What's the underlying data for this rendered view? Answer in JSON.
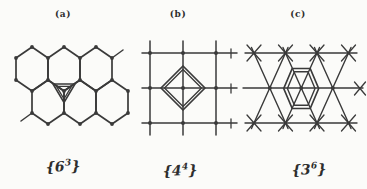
{
  "figure": {
    "colors": {
      "ink": "#3a3a3a",
      "paper": "#fbfbf9"
    },
    "panels": [
      {
        "caption": "(a)",
        "lattice": "honeycomb",
        "symbol": {
          "open": "{",
          "base": "6",
          "sup": "3",
          "close": "}"
        }
      },
      {
        "caption": "(b)",
        "lattice": "square",
        "symbol": {
          "open": "{",
          "base": "4",
          "sup": "4",
          "close": "}"
        }
      },
      {
        "caption": "(c)",
        "lattice": "triangular",
        "symbol": {
          "open": "{",
          "base": "3",
          "sup": "6",
          "close": "}"
        }
      }
    ]
  }
}
